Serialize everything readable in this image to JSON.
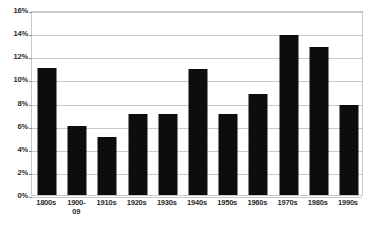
{
  "chart_data": {
    "type": "bar",
    "title": "",
    "subtitle": "",
    "xlabel": "",
    "ylabel": "",
    "categories": [
      "1800s",
      "1900-\n09",
      "1910s",
      "1920s",
      "1930s",
      "1940s",
      "1950s",
      "1960s",
      "1970s",
      "1980s",
      "1990s"
    ],
    "values": [
      11.0,
      6.0,
      5.0,
      7.0,
      7.0,
      10.9,
      7.0,
      8.7,
      13.8,
      12.8,
      7.8
    ],
    "value_unit": "%",
    "ylim": [
      0,
      16
    ],
    "ytick_values": [
      0,
      2,
      4,
      6,
      8,
      10,
      12,
      14,
      16
    ],
    "ytick_labels": [
      "0%",
      "2%",
      "4%",
      "6%",
      "8%",
      "10%",
      "12%",
      "14%",
      "16%"
    ],
    "grid": true,
    "legend": false,
    "legend_position": "none",
    "bar_color": "#0d0d0d",
    "grid_color": "#c8c8c8",
    "plot_background": "#ffffff",
    "text_color": "#2b2b2b"
  }
}
